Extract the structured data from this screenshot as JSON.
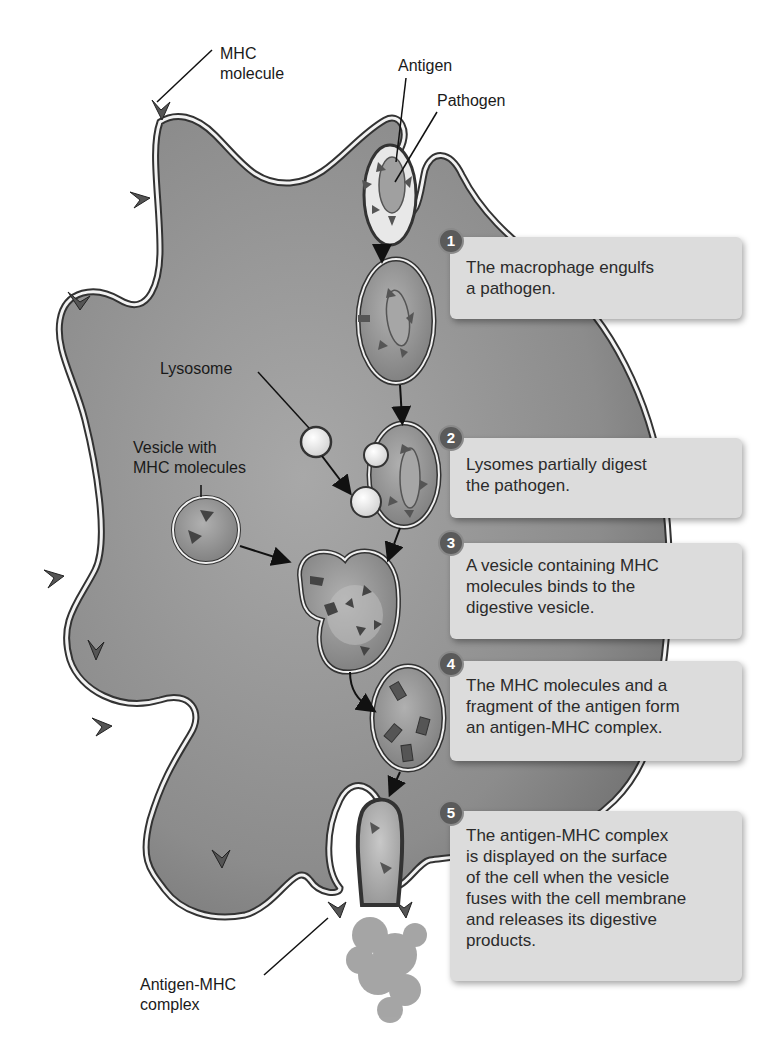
{
  "figure": {
    "colors": {
      "cytoplasm": "#8e8e8e",
      "membrane_outer": "#3a3a3a",
      "membrane_inner": "#f2f2f2",
      "vesicle_fill": "#9c9c9c",
      "step_box": "#dcdcdc",
      "step_badge": "#5a5a5a",
      "text": "#2b2b2b"
    }
  },
  "labels": {
    "mhc_molecule": [
      "MHC",
      "molecule"
    ],
    "antigen": "Antigen",
    "pathogen": "Pathogen",
    "lysosome": "Lysosome",
    "vesicle_with_mhc": [
      "Vesicle with",
      "MHC molecules"
    ],
    "antigen_mhc_complex": [
      "Antigen-MHC",
      "complex"
    ]
  },
  "steps": [
    {
      "number": "1",
      "lines": [
        "The macrophage engulfs",
        "a pathogen."
      ]
    },
    {
      "number": "2",
      "lines": [
        "Lysomes partially digest",
        "the pathogen."
      ]
    },
    {
      "number": "3",
      "lines": [
        "A vesicle containing MHC",
        "molecules binds to the",
        "digestive vesicle."
      ]
    },
    {
      "number": "4",
      "lines": [
        "The MHC molecules and a",
        "fragment of the antigen form",
        "an antigen-MHC complex."
      ]
    },
    {
      "number": "5",
      "lines": [
        "The antigen-MHC complex",
        "is displayed on the surface",
        "of the cell when the vesicle",
        "fuses with the cell membrane",
        "and releases its digestive",
        "products."
      ]
    }
  ]
}
